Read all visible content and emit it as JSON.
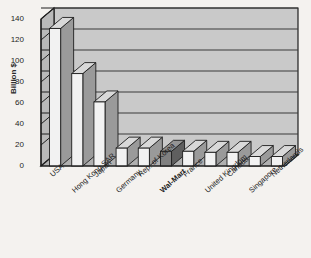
{
  "chart_data": {
    "type": "bar",
    "title": "",
    "subtitle": "",
    "xlabel": "",
    "ylabel": "Billion $",
    "ylim": [
      0,
      140
    ],
    "ytick_step": 20,
    "yticks": [
      "0",
      "20",
      "40",
      "60",
      "80",
      "100",
      "120",
      "140"
    ],
    "grid": true,
    "legend": "none",
    "style": "3d-column",
    "categories": [
      "USA",
      "Hong Kong SAR",
      "Japan",
      "Germany",
      "Rep. of Korea",
      "Wal-Mart",
      "France",
      "United Kingdom",
      "Canada",
      "Singapore",
      "Netherlands"
    ],
    "values": [
      131,
      88,
      61,
      17,
      17,
      14,
      14,
      13,
      13,
      9,
      9
    ],
    "highlight_index": 5,
    "highlight_label": "Wal-Mart",
    "colors": {
      "bar_fill": "#f2f2f2",
      "bar_highlight_fill": "#808080",
      "bar_side": "#9a9a9a",
      "bar_top": "#d9d9d9",
      "plot_background": "#c9c9c9",
      "floor": "#b0b0b0",
      "gridline": "#3a3a3a",
      "axis": "#1e1e1e",
      "page_background": "#f4f2ef",
      "text": "#1e1e1e"
    }
  }
}
